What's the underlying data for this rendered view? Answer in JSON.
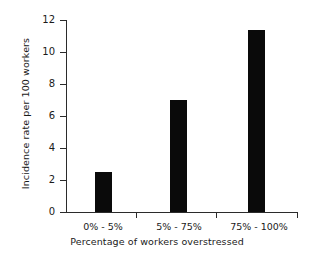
{
  "chart_data": {
    "type": "bar",
    "title": "",
    "categories": [
      "0% - 5%",
      "5% - 75%",
      "75% - 100%"
    ],
    "values": [
      2.5,
      7.0,
      11.4
    ],
    "xlabel": "Percentage of workers overstressed",
    "ylabel": "Incidence rate per 100 workers",
    "ylim": [
      0,
      12
    ],
    "yticks": [
      0,
      2,
      4,
      6,
      8,
      10,
      12
    ],
    "ytick_labels": [
      "0",
      "2",
      "4",
      "6",
      "8",
      "10",
      "12"
    ],
    "grid": false,
    "legend": false,
    "bar_color": "#0a0a0a",
    "axis_color": "#2b2b2b",
    "background": "#ffffff"
  }
}
